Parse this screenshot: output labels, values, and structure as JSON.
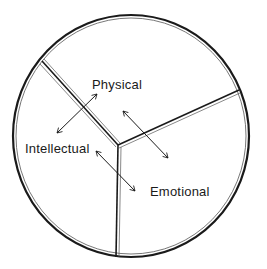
{
  "diagram": {
    "type": "pie-divided-circle",
    "segments": [
      {
        "label": "Physical"
      },
      {
        "label": "Intellectual"
      },
      {
        "label": "Emotional"
      }
    ],
    "arrows": [
      {
        "between": [
          "Physical",
          "Intellectual"
        ],
        "style": "double-headed"
      },
      {
        "between": [
          "Physical",
          "Emotional"
        ],
        "style": "double-headed"
      },
      {
        "between": [
          "Intellectual",
          "Emotional"
        ],
        "style": "double-headed"
      }
    ],
    "colors": {
      "line": "#1a1a1a",
      "background": "#ffffff"
    }
  }
}
